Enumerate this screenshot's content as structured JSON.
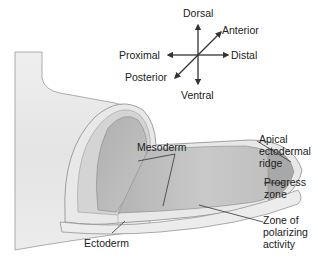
{
  "axes": {
    "dorsal": "Dorsal",
    "ventral": "Ventral",
    "proximal": "Proximal",
    "distal": "Distal",
    "anterior": "Anterior",
    "posterior": "Posterior"
  },
  "labels": {
    "mesoderm": "Mesoderm",
    "aer_line1": "Apical",
    "aer_line2": "ectodermal",
    "aer_line3": "ridge",
    "progress_line1": "Progress",
    "progress_line2": "zone",
    "zpa_line1": "Zone of",
    "zpa_line2": "polarizing",
    "zpa_line3": "activity",
    "ectoderm": "Ectoderm"
  },
  "colors": {
    "ectoderm_surface": "#e6e6e6",
    "mesoderm_fill": "#bdbdbd",
    "mesoderm_dark": "#a9a9a9",
    "outline": "#555555",
    "text": "#222222"
  }
}
